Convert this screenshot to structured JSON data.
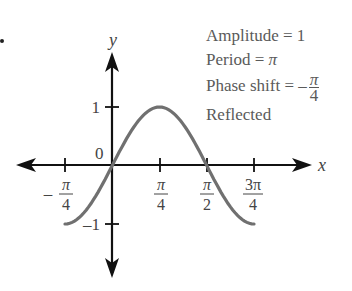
{
  "info": {
    "amplitude_label": "Amplitude = 1",
    "period_prefix": "Period = ",
    "period_value": "π",
    "phase_prefix": "Phase shift = –",
    "phase_num": "π",
    "phase_den": "4",
    "reflected_label": "Reflected"
  },
  "axes": {
    "x_label": "x",
    "y_label": "y",
    "origin_label": "0",
    "y_tick_1": "1",
    "y_tick_neg1": "–1",
    "x_ticks": [
      {
        "sign": "–",
        "num": "π",
        "den": "4"
      },
      {
        "sign": "",
        "num": "π",
        "den": "4"
      },
      {
        "sign": "",
        "num": "π",
        "den": "2"
      },
      {
        "sign": "",
        "num": "3π",
        "den": "4"
      }
    ]
  },
  "colors": {
    "axis": "#111111",
    "curve": "#707070",
    "text": "#5a5a5a"
  },
  "chart_data": {
    "type": "line",
    "title": "",
    "function": "y = -sin(2(x + π/4)) reflected form; plotted from x = -π/4 to 3π/4",
    "xlabel": "x",
    "ylabel": "y",
    "x_tick_labels": [
      "-π/4",
      "π/4",
      "π/2",
      "3π/4"
    ],
    "y_tick_labels": [
      "-1",
      "1"
    ],
    "xlim": [
      -0.785,
      2.356
    ],
    "ylim": [
      -1,
      1
    ],
    "grid": false,
    "series": [
      {
        "name": "curve",
        "x": [
          -0.785,
          -0.589,
          -0.393,
          -0.196,
          0,
          0.196,
          0.393,
          0.589,
          0.785,
          0.982,
          1.178,
          1.374,
          1.571,
          1.767,
          1.963,
          2.16,
          2.356
        ],
        "values": [
          -1,
          -0.924,
          -0.707,
          -0.383,
          0,
          0.383,
          0.707,
          0.924,
          1,
          0.924,
          0.707,
          0.383,
          0,
          -0.383,
          -0.707,
          -0.924,
          -1
        ]
      }
    ],
    "annotations": [
      "Amplitude = 1",
      "Period = π",
      "Phase shift = -π/4",
      "Reflected"
    ]
  }
}
